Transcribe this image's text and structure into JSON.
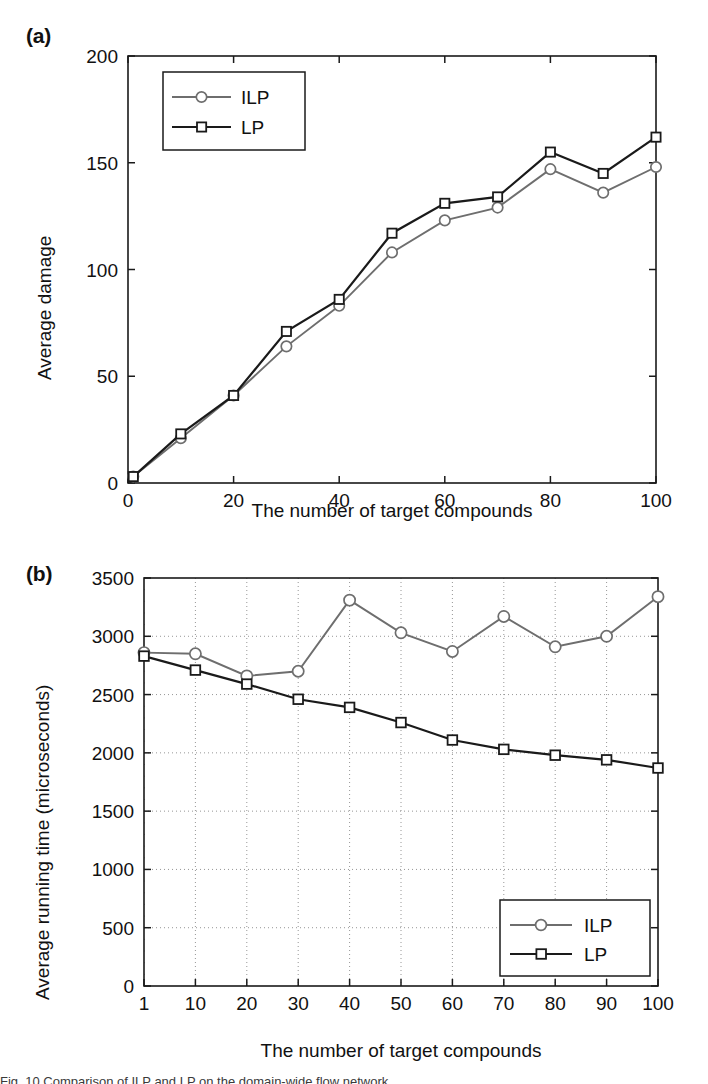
{
  "figure": {
    "panel_a_label": "(a)",
    "panel_b_label": "(b)",
    "caption_partial": "Fig. 10 Comparison of ILP and LP on the domain-wide flow network"
  },
  "chart_data": [
    {
      "id": "panel-a",
      "type": "line",
      "title": "",
      "panel": "(a)",
      "xlabel": "The number of target compounds",
      "ylabel": "Average damage",
      "x": [
        1,
        10,
        20,
        30,
        40,
        50,
        60,
        70,
        80,
        90,
        100
      ],
      "xtick_labels": [
        "0",
        "20",
        "40",
        "60",
        "80",
        "100"
      ],
      "xticks": [
        0,
        20,
        40,
        60,
        80,
        100
      ],
      "xlim": [
        0,
        100
      ],
      "ytick_labels": [
        "0",
        "50",
        "100",
        "150",
        "200"
      ],
      "yticks": [
        0,
        50,
        100,
        150,
        200
      ],
      "ylim": [
        0,
        200
      ],
      "x_scale": "linear",
      "grid": false,
      "legend_position": "top-left-inside",
      "series": [
        {
          "name": "ILP",
          "color": "#6e6e6e",
          "marker": "circle",
          "values": [
            3,
            21,
            41,
            64,
            83,
            108,
            123,
            129,
            147,
            136,
            148
          ]
        },
        {
          "name": "LP",
          "color": "#1a1a1a",
          "marker": "square",
          "values": [
            3,
            23,
            41,
            71,
            86,
            117,
            131,
            134,
            155,
            145,
            162
          ]
        }
      ]
    },
    {
      "id": "panel-b",
      "type": "line",
      "title": "",
      "panel": "(b)",
      "xlabel": "The number of target compounds",
      "ylabel": "Average running time (microseconds)",
      "categories": [
        "1",
        "10",
        "20",
        "30",
        "40",
        "50",
        "60",
        "70",
        "80",
        "90",
        "100"
      ],
      "xtick_labels": [
        "1",
        "10",
        "20",
        "30",
        "40",
        "50",
        "60",
        "70",
        "80",
        "90",
        "100"
      ],
      "ytick_labels": [
        "0",
        "500",
        "1000",
        "1500",
        "2000",
        "2500",
        "3000",
        "3500"
      ],
      "yticks": [
        0,
        500,
        1000,
        1500,
        2000,
        2500,
        3000,
        3500
      ],
      "ylim": [
        0,
        3500
      ],
      "x_scale": "categorical",
      "grid": true,
      "legend_position": "bottom-right-inside",
      "series": [
        {
          "name": "ILP",
          "color": "#6e6e6e",
          "marker": "circle",
          "values": [
            2860,
            2850,
            2660,
            2700,
            3310,
            3030,
            2870,
            3170,
            2910,
            3000,
            3340
          ]
        },
        {
          "name": "LP",
          "color": "#1a1a1a",
          "marker": "square",
          "values": [
            2830,
            2710,
            2590,
            2460,
            2390,
            2260,
            2110,
            2030,
            1980,
            1940,
            1870
          ]
        }
      ]
    }
  ]
}
